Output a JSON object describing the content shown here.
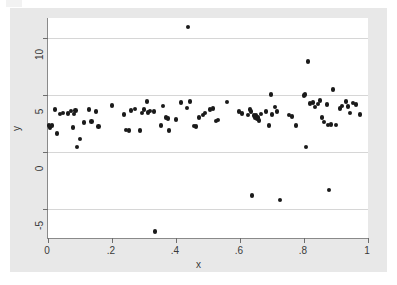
{
  "chart_data": {
    "type": "scatter",
    "title": "",
    "xlabel": "x",
    "ylabel": "y",
    "xlim": [
      0,
      1
    ],
    "ylim": [
      -7.6,
      11.8
    ],
    "grid": true,
    "gridlines_y": [
      10,
      5,
      0,
      -5
    ],
    "legend": null,
    "xticks": [
      0,
      0.2,
      0.4,
      0.6,
      0.8,
      1
    ],
    "xticklabels": [
      "0",
      ".2",
      ".4",
      ".6",
      ".8",
      "1"
    ],
    "yticks": [
      10,
      5,
      0,
      -5
    ],
    "yticklabels": [
      "10",
      "5",
      "0",
      "-5"
    ],
    "marker": "filled-circle",
    "marker_color": "#1a1a1a",
    "series": [
      {
        "name": "y",
        "points": [
          [
            0.003,
            2.3
          ],
          [
            0.006,
            2.16
          ],
          [
            0.013,
            2.3
          ],
          [
            0.022,
            3.75
          ],
          [
            0.028,
            1.62
          ],
          [
            0.038,
            3.35
          ],
          [
            0.047,
            3.42
          ],
          [
            0.063,
            3.4
          ],
          [
            0.072,
            3.59
          ],
          [
            0.078,
            2.13
          ],
          [
            0.081,
            3.35
          ],
          [
            0.086,
            3.62
          ],
          [
            0.091,
            0.44
          ],
          [
            0.1,
            1.13
          ],
          [
            0.113,
            2.58
          ],
          [
            0.128,
            3.75
          ],
          [
            0.136,
            2.66
          ],
          [
            0.15,
            3.53
          ],
          [
            0.158,
            2.21
          ],
          [
            0.2,
            4.08
          ],
          [
            0.238,
            3.27
          ],
          [
            0.244,
            1.92
          ],
          [
            0.253,
            1.9
          ],
          [
            0.259,
            3.65
          ],
          [
            0.272,
            3.78
          ],
          [
            0.288,
            1.88
          ],
          [
            0.294,
            3.42
          ],
          [
            0.3,
            3.72
          ],
          [
            0.309,
            4.42
          ],
          [
            0.313,
            3.48
          ],
          [
            0.319,
            3.61
          ],
          [
            0.331,
            3.56
          ],
          [
            0.334,
            -7.05
          ],
          [
            0.353,
            2.34
          ],
          [
            0.359,
            4.05
          ],
          [
            0.369,
            3.0
          ],
          [
            0.375,
            2.92
          ],
          [
            0.378,
            1.88
          ],
          [
            0.4,
            2.85
          ],
          [
            0.416,
            4.36
          ],
          [
            0.434,
            3.86
          ],
          [
            0.437,
            11.0
          ],
          [
            0.444,
            4.44
          ],
          [
            0.456,
            2.29
          ],
          [
            0.462,
            2.22
          ],
          [
            0.472,
            3.05
          ],
          [
            0.484,
            3.25
          ],
          [
            0.491,
            3.44
          ],
          [
            0.506,
            3.72
          ],
          [
            0.516,
            3.81
          ],
          [
            0.525,
            2.73
          ],
          [
            0.531,
            2.8
          ],
          [
            0.559,
            4.38
          ],
          [
            0.597,
            3.58
          ],
          [
            0.606,
            3.4
          ],
          [
            0.625,
            3.25
          ],
          [
            0.631,
            3.75
          ],
          [
            0.634,
            3.55
          ],
          [
            0.638,
            -3.85
          ],
          [
            0.644,
            3.18
          ],
          [
            0.647,
            3.05
          ],
          [
            0.65,
            3.22
          ],
          [
            0.653,
            2.92
          ],
          [
            0.656,
            3.02
          ],
          [
            0.659,
            2.78
          ],
          [
            0.666,
            3.33
          ],
          [
            0.681,
            3.58
          ],
          [
            0.691,
            2.32
          ],
          [
            0.697,
            5.05
          ],
          [
            0.7,
            3.3
          ],
          [
            0.709,
            3.95
          ],
          [
            0.716,
            3.55
          ],
          [
            0.725,
            -4.25
          ],
          [
            0.753,
            3.25
          ],
          [
            0.763,
            3.12
          ],
          [
            0.775,
            2.3
          ],
          [
            0.8,
            4.96
          ],
          [
            0.803,
            5.08
          ],
          [
            0.806,
            0.44
          ],
          [
            0.812,
            7.95
          ],
          [
            0.819,
            4.28
          ],
          [
            0.828,
            4.36
          ],
          [
            0.834,
            3.95
          ],
          [
            0.844,
            4.22
          ],
          [
            0.85,
            4.5
          ],
          [
            0.856,
            3.05
          ],
          [
            0.863,
            2.62
          ],
          [
            0.872,
            4.15
          ],
          [
            0.875,
            2.38
          ],
          [
            0.878,
            -3.35
          ],
          [
            0.884,
            2.4
          ],
          [
            0.891,
            5.5
          ],
          [
            0.9,
            2.38
          ],
          [
            0.912,
            3.82
          ],
          [
            0.919,
            4.05
          ],
          [
            0.931,
            4.42
          ],
          [
            0.937,
            4.0
          ],
          [
            0.944,
            3.42
          ],
          [
            0.953,
            4.32
          ],
          [
            0.962,
            4.15
          ],
          [
            0.975,
            3.28
          ]
        ]
      }
    ]
  },
  "axes": {
    "y_title": "y",
    "x_title": "x"
  }
}
